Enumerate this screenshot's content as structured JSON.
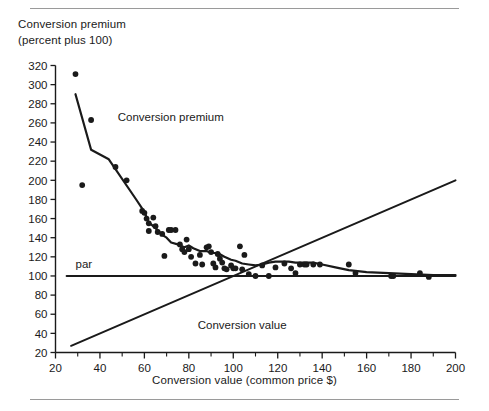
{
  "figure": {
    "y_axis_title": "Conversion premium\n(percent plus 100)",
    "x_axis_title": "Conversion value (common price $)",
    "rule_color": "#9a9a9a",
    "ink_color": "#1a1a1a"
  },
  "chart_data": {
    "type": "scatter",
    "title": "Conversion premium (percent plus 100)",
    "xlabel": "Conversion value (common price $)",
    "ylabel": "Conversion premium (percent plus 100)",
    "xlim": [
      20,
      200
    ],
    "ylim": [
      20,
      320
    ],
    "xticks": [
      20,
      40,
      60,
      80,
      100,
      120,
      140,
      160,
      180,
      200
    ],
    "xtick_labels": [
      "20",
      "40",
      "60",
      "80",
      "100",
      "120",
      "140",
      "160",
      "180",
      "200"
    ],
    "x_minor_ticks": [
      30,
      50,
      70,
      90,
      110,
      130,
      150,
      170,
      190
    ],
    "yticks": [
      20,
      40,
      60,
      80,
      100,
      120,
      140,
      160,
      180,
      200,
      220,
      240,
      260,
      280,
      300,
      320
    ],
    "ytick_labels": [
      "20",
      "40",
      "60",
      "80",
      "100",
      "120",
      "140",
      "160",
      "180",
      "200",
      "220",
      "240",
      "260",
      "280",
      "300",
      "320"
    ],
    "grid": false,
    "legend": "none",
    "annotations": [
      {
        "text": "Conversion premium",
        "x": 48,
        "y": 262
      },
      {
        "text": "par",
        "x": 29,
        "y": 108
      },
      {
        "text": "Conversion value",
        "x": 84,
        "y": 45
      }
    ],
    "series": [
      {
        "name": "Conversion premium (scatter)",
        "type": "scatter",
        "marker": "filled-circle",
        "points": [
          [
            29,
            311
          ],
          [
            32,
            195
          ],
          [
            36,
            263
          ],
          [
            47,
            214
          ],
          [
            52,
            200
          ],
          [
            59,
            168
          ],
          [
            60,
            166
          ],
          [
            61,
            160
          ],
          [
            62,
            155
          ],
          [
            62,
            147
          ],
          [
            64,
            161
          ],
          [
            65,
            152
          ],
          [
            66,
            146
          ],
          [
            68,
            144
          ],
          [
            69,
            121
          ],
          [
            71,
            148
          ],
          [
            72,
            148
          ],
          [
            74,
            148
          ],
          [
            76,
            133
          ],
          [
            77,
            128
          ],
          [
            78,
            125
          ],
          [
            79,
            138
          ],
          [
            80,
            128
          ],
          [
            81,
            120
          ],
          [
            83,
            113
          ],
          [
            85,
            122
          ],
          [
            86,
            112
          ],
          [
            88,
            130
          ],
          [
            89,
            131
          ],
          [
            90,
            125
          ],
          [
            91,
            113
          ],
          [
            92,
            109
          ],
          [
            93,
            123
          ],
          [
            94,
            118
          ],
          [
            95,
            114
          ],
          [
            96,
            108
          ],
          [
            97,
            107
          ],
          [
            99,
            111
          ],
          [
            100,
            108
          ],
          [
            101,
            108
          ],
          [
            103,
            131
          ],
          [
            104,
            107
          ],
          [
            105,
            122
          ],
          [
            107,
            102
          ],
          [
            110,
            100
          ],
          [
            113,
            111
          ],
          [
            116,
            100
          ],
          [
            119,
            109
          ],
          [
            123,
            113
          ],
          [
            126,
            108
          ],
          [
            128,
            103
          ],
          [
            130,
            112
          ],
          [
            132,
            112
          ],
          [
            133,
            112
          ],
          [
            136,
            112
          ],
          [
            139,
            112
          ],
          [
            152,
            112
          ],
          [
            155,
            103
          ],
          [
            171,
            100
          ],
          [
            172,
            100
          ],
          [
            184,
            103
          ],
          [
            188,
            99
          ]
        ]
      },
      {
        "name": "Conversion premium (fitted curve)",
        "type": "line",
        "points": [
          [
            29,
            290
          ],
          [
            36,
            232
          ],
          [
            44,
            222
          ],
          [
            56,
            181
          ],
          [
            60,
            167
          ],
          [
            62,
            156
          ],
          [
            65,
            150
          ],
          [
            68,
            143
          ],
          [
            70,
            140
          ],
          [
            72,
            135
          ],
          [
            75,
            133
          ],
          [
            78,
            130
          ],
          [
            80,
            132
          ],
          [
            82,
            129
          ],
          [
            85,
            126
          ],
          [
            88,
            126
          ],
          [
            90,
            124
          ],
          [
            93,
            124
          ],
          [
            96,
            120
          ],
          [
            99,
            117
          ],
          [
            101,
            116
          ],
          [
            104,
            113
          ],
          [
            107,
            112
          ],
          [
            110,
            111
          ],
          [
            113,
            112
          ],
          [
            116,
            114
          ],
          [
            119,
            115
          ],
          [
            122,
            115
          ],
          [
            125,
            115
          ],
          [
            128,
            114
          ],
          [
            132,
            114
          ],
          [
            136,
            114
          ],
          [
            140,
            112
          ],
          [
            146,
            109
          ],
          [
            152,
            106
          ],
          [
            160,
            104
          ],
          [
            170,
            103
          ],
          [
            180,
            102
          ],
          [
            190,
            101
          ],
          [
            200,
            101
          ]
        ]
      },
      {
        "name": "par",
        "type": "line",
        "points": [
          [
            25,
            100
          ],
          [
            200,
            100
          ]
        ]
      },
      {
        "name": "Conversion value",
        "type": "line",
        "points": [
          [
            27,
            27
          ],
          [
            200,
            200
          ]
        ]
      }
    ]
  }
}
